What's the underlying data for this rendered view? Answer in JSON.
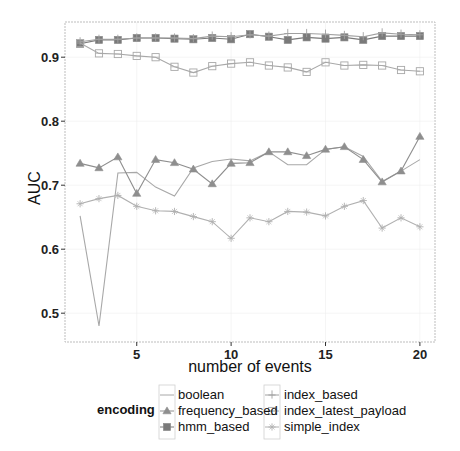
{
  "chart_data": {
    "type": "line",
    "title": "",
    "xlabel": "number of events",
    "ylabel": "AUC",
    "xlim": [
      1.2,
      20.8
    ],
    "ylim": [
      0.455,
      0.955
    ],
    "x_ticks": [
      5,
      10,
      15,
      20
    ],
    "y_ticks": [
      0.5,
      0.6,
      0.7,
      0.8,
      0.9
    ],
    "x_tick_labels": [
      "5",
      "10",
      "15",
      "20"
    ],
    "y_tick_labels": [
      "0.5",
      "0.6",
      "0.7",
      "0.8",
      "0.9"
    ],
    "grid": true,
    "legend_position": "bottom",
    "legend_title": "encoding",
    "x": [
      2,
      3,
      4,
      5,
      6,
      7,
      8,
      9,
      10,
      11,
      12,
      13,
      14,
      15,
      16,
      17,
      18,
      19,
      20
    ],
    "series": [
      {
        "name": "boolean",
        "marker": "none",
        "color": "#a8a8a8",
        "values": [
          0.652,
          0.48,
          0.719,
          0.72,
          0.697,
          0.683,
          0.727,
          0.737,
          0.741,
          0.738,
          0.752,
          0.732,
          0.732,
          0.756,
          0.76,
          0.745,
          0.706,
          0.722,
          0.74
        ]
      },
      {
        "name": "frequency_based",
        "marker": "triangle",
        "color": "#8e8e8e",
        "values": [
          0.734,
          0.727,
          0.744,
          0.687,
          0.74,
          0.735,
          0.725,
          0.702,
          0.734,
          0.735,
          0.752,
          0.752,
          0.746,
          0.756,
          0.76,
          0.74,
          0.705,
          0.722,
          0.776
        ]
      },
      {
        "name": "hmm_based",
        "marker": "filled-square",
        "color": "#7a7a7a",
        "values": [
          0.921,
          0.927,
          0.927,
          0.93,
          0.93,
          0.929,
          0.928,
          0.93,
          0.928,
          0.936,
          0.932,
          0.927,
          0.931,
          0.929,
          0.931,
          0.927,
          0.933,
          0.933,
          0.933
        ]
      },
      {
        "name": "index_based",
        "marker": "plus",
        "color": "#a0a0a0",
        "values": [
          0.924,
          0.928,
          0.928,
          0.93,
          0.93,
          0.93,
          0.929,
          0.933,
          0.932,
          0.935,
          0.933,
          0.937,
          0.937,
          0.936,
          0.934,
          0.932,
          0.938,
          0.936,
          0.935
        ]
      },
      {
        "name": "index_latest_payload",
        "marker": "open-square",
        "color": "#a8a8a8",
        "values": [
          0.922,
          0.906,
          0.905,
          0.902,
          0.9,
          0.885,
          0.876,
          0.886,
          0.89,
          0.892,
          0.887,
          0.884,
          0.877,
          0.892,
          0.887,
          0.888,
          0.887,
          0.88,
          0.878
        ]
      },
      {
        "name": "simple_index",
        "marker": "star",
        "color": "#b0b0b0",
        "values": [
          0.671,
          0.679,
          0.684,
          0.667,
          0.66,
          0.659,
          0.651,
          0.643,
          0.617,
          0.649,
          0.643,
          0.659,
          0.658,
          0.652,
          0.667,
          0.676,
          0.633,
          0.649,
          0.635
        ]
      }
    ]
  },
  "legend": {
    "title": "encoding",
    "items": [
      {
        "label": "boolean"
      },
      {
        "label": "frequency_based"
      },
      {
        "label": "hmm_based"
      },
      {
        "label": "index_based"
      },
      {
        "label": "index_latest_payload"
      },
      {
        "label": "simple_index"
      }
    ]
  },
  "axes": {
    "x_title": "number of events",
    "y_title": "AUC"
  }
}
